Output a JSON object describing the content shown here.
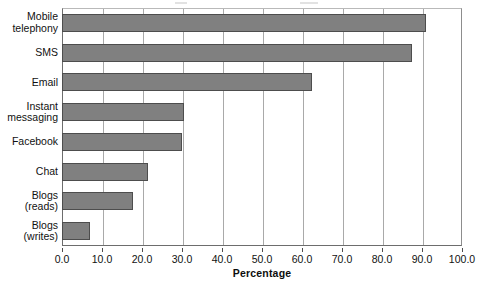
{
  "chart_data": {
    "type": "bar",
    "orientation": "horizontal",
    "title": "",
    "xlabel": "Percentage",
    "ylabel": "",
    "xlim": [
      0,
      100
    ],
    "xticks": [
      "0.0",
      "10.0",
      "20.0",
      "30.0",
      "40.0",
      "50.0",
      "60.0",
      "70.0",
      "80.0",
      "90.0",
      "100.0"
    ],
    "xtick_step": 10,
    "grid": true,
    "grid_axis": "x",
    "legend": "none",
    "bar_color": "#808080",
    "bar_edge_color": "#4d4d4d",
    "background": "#ffffff",
    "categories": [
      "Mobile\ntelephony",
      "SMS",
      "Email",
      "Instant\nmessaging",
      "Facebook",
      "Chat",
      "Blogs\n(reads)",
      "Blogs\n(writes)"
    ],
    "values": [
      91.0,
      87.5,
      62.5,
      30.5,
      30.0,
      21.5,
      17.8,
      7.0
    ]
  },
  "axis": {
    "x_title": "Percentage"
  }
}
